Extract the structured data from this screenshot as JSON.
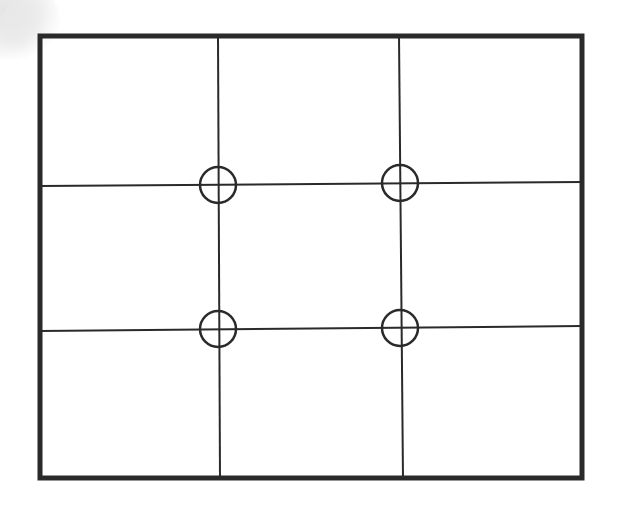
{
  "diagram": {
    "title": "",
    "type": "rule-of-thirds-grid",
    "frame": {
      "x1": 40,
      "y1": 36,
      "x2": 582,
      "y2": 478,
      "stroke": "#2a2a2a",
      "stroke_width": 5
    },
    "grid_lines": {
      "vertical": [
        {
          "x1": 218,
          "y1": 36,
          "x2": 220,
          "y2": 478
        },
        {
          "x1": 399,
          "y1": 36,
          "x2": 403,
          "y2": 478
        }
      ],
      "horizontal": [
        {
          "x1": 40,
          "y1": 186,
          "x2": 582,
          "y2": 182
        },
        {
          "x1": 40,
          "y1": 331,
          "x2": 582,
          "y2": 326
        }
      ],
      "stroke": "#2a2a2a",
      "stroke_width": 2
    },
    "power_points": [
      {
        "cx": 218,
        "cy": 185,
        "r": 18
      },
      {
        "cx": 400,
        "cy": 183,
        "r": 18
      },
      {
        "cx": 218,
        "cy": 329,
        "r": 18
      },
      {
        "cx": 400,
        "cy": 328,
        "r": 18
      }
    ],
    "cells": 9
  }
}
